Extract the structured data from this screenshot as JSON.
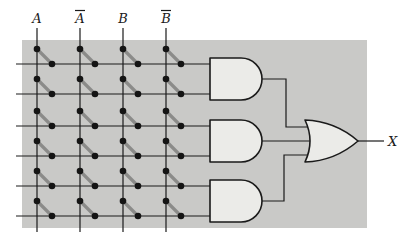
{
  "figure": {
    "type": "pla-fuse-array-logic-diagram",
    "inputs": [
      {
        "label": "A",
        "complement": false
      },
      {
        "label": "A",
        "complement": true
      },
      {
        "label": "B",
        "complement": false
      },
      {
        "label": "B",
        "complement": true
      }
    ],
    "row_count": 6,
    "fuses_per_row": 4,
    "and_gates": [
      {
        "id": "and-gate-1",
        "type": "AND",
        "input_rows": [
          1,
          2
        ]
      },
      {
        "id": "and-gate-2",
        "type": "AND",
        "input_rows": [
          3,
          4
        ]
      },
      {
        "id": "and-gate-3",
        "type": "AND",
        "input_rows": [
          5,
          6
        ]
      }
    ],
    "or_gate": {
      "id": "or-gate",
      "type": "OR",
      "inputs": [
        "and-gate-1",
        "and-gate-2",
        "and-gate-3"
      ]
    },
    "output_label": "X",
    "colors": {
      "page_background": "#ffffff",
      "array_panel": "#c9c9c7",
      "gate_fill": "#ebebe8",
      "line": "#1a1a1a",
      "fuse": "#8b8b89",
      "dot": "#141414"
    }
  }
}
